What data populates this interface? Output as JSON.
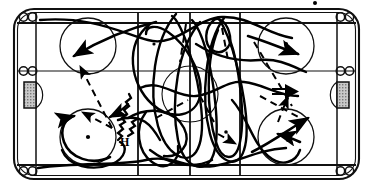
{
  "diagram": {
    "type": "ice-hockey-rink-drill",
    "labels": [
      {
        "id": "h-label",
        "text": "H",
        "x": 120,
        "y": 142
      }
    ],
    "colors": {
      "ink": "#000000",
      "paper": "#ffffff",
      "goal_fill": "#b8b8b8",
      "line": "#1a1a1a"
    },
    "rink": {
      "boards_label": "rink boards",
      "corner_radius": 20,
      "bench_door_label": "bench door marks",
      "goal_label": "goal net",
      "crease_label": "goal crease",
      "blue_line_label": "blue line",
      "center_line_label": "center red line",
      "goal_line_label": "goal line",
      "faceoff_circle_label": "faceoff circle",
      "faceoff_dot_label": "faceoff dot"
    },
    "legend": {
      "solid_line": "skating path",
      "dashed_line": "pass",
      "wavy_line": "puck carry",
      "double_arrow": "shot"
    },
    "counts": {
      "faceoff_circles": 4,
      "goals": 2,
      "vertical_lines": 3,
      "horizontal_lines": 2
    }
  }
}
